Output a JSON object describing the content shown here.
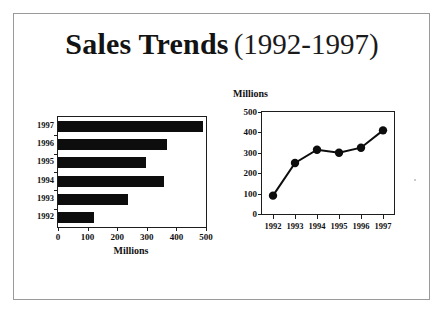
{
  "slide": {
    "title_main": "Sales Trends",
    "title_range": "(1992-1997)",
    "background_color": "#ffffff",
    "border_color": "#9a9a9a",
    "ink_color": "#0d0d0d"
  },
  "chart_data": [
    {
      "type": "bar",
      "orientation": "horizontal",
      "title": "",
      "categories": [
        "1992",
        "1993",
        "1994",
        "1995",
        "1996",
        "1997"
      ],
      "values": [
        120,
        235,
        358,
        297,
        367,
        490
      ],
      "display_order": [
        "1997",
        "1996",
        "1995",
        "1994",
        "1993",
        "1992"
      ],
      "xlabel": "Millions",
      "ylabel": "",
      "xlim": [
        0,
        500
      ],
      "xticks": [
        0,
        100,
        200,
        300,
        400,
        500
      ],
      "xtick_labels": [
        "0",
        "100",
        "200",
        "300",
        "400",
        "500"
      ],
      "grid": false,
      "legend": false,
      "bar_color": "#0d0d0d"
    },
    {
      "type": "line",
      "title": "",
      "axis_title": "Millions",
      "x": [
        "1992",
        "1993",
        "1994",
        "1995",
        "1996",
        "1997"
      ],
      "values": [
        90,
        250,
        315,
        300,
        325,
        410
      ],
      "xlabel": "",
      "ylabel": "Millions",
      "ylim": [
        0,
        500
      ],
      "yticks": [
        0,
        100,
        200,
        300,
        400,
        500
      ],
      "ytick_labels": [
        "0",
        "100",
        "200",
        "300",
        "400",
        "500"
      ],
      "xtick_labels": [
        "1992",
        "1993",
        "1994",
        "1995",
        "1996",
        "1997"
      ],
      "grid": false,
      "legend": false,
      "marker": "circle",
      "line_color": "#0d0d0d",
      "marker_color": "#0d0d0d"
    }
  ]
}
